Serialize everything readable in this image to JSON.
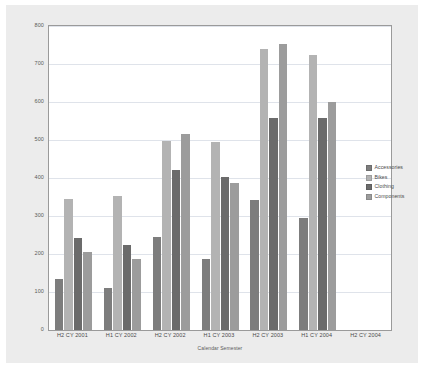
{
  "chart_data": {
    "type": "bar",
    "title": "",
    "xlabel": "Calendar Semester",
    "ylabel": "",
    "ylim": [
      0,
      800
    ],
    "ytick_step": 100,
    "yticks": [
      "0",
      "100",
      "200",
      "300",
      "400",
      "500",
      "600",
      "700",
      "800"
    ],
    "grid": true,
    "legend_position": "right",
    "categories": [
      "H2 CY 2001",
      "H1 CY 2002",
      "H2 CY 2002",
      "H1 CY 2003",
      "H2 CY 2003",
      "H1 CY 2004",
      "H2 CY 2004"
    ],
    "series": [
      {
        "name": "Accessories",
        "color": "#7d7d7d",
        "values": [
          135,
          110,
          245,
          188,
          343,
          295,
          null
        ]
      },
      {
        "name": "Bikes",
        "color": "#b3b3b3",
        "values": [
          345,
          353,
          498,
          495,
          740,
          725,
          null
        ]
      },
      {
        "name": "Clothing",
        "color": "#6b6b6b",
        "values": [
          242,
          223,
          420,
          403,
          557,
          557,
          null
        ]
      },
      {
        "name": "Components",
        "color": "#9c9c9c",
        "values": [
          204,
          187,
          515,
          388,
          752,
          601,
          null
        ]
      }
    ]
  },
  "legend": {
    "items": [
      {
        "label": "Accessories",
        "color": "#7d7d7d"
      },
      {
        "label": "Bikes",
        "color": "#b3b3b3"
      },
      {
        "label": "Clothing",
        "color": "#6b6b6b"
      },
      {
        "label": "Components",
        "color": "#9c9c9c"
      }
    ]
  },
  "colors": {
    "page_background": "#ffffff",
    "panel_background": "#ececec",
    "plot_background": "#ffffff",
    "plot_border": "#9a9a9a",
    "gridline": "#dfe3ea",
    "axis_text": "#5a5a5a"
  }
}
